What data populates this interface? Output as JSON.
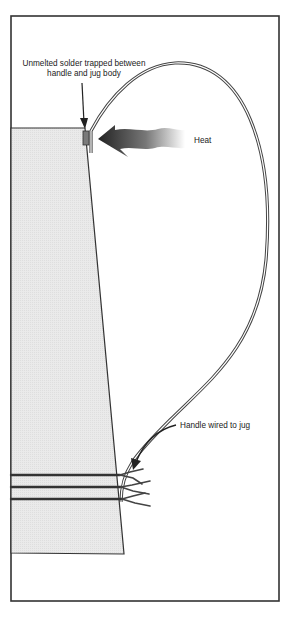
{
  "diagram": {
    "title": "",
    "labels": {
      "solder": "Unmelted solder trapped between handle and jug body",
      "heat": "Heat",
      "wired": "Handle wired to jug"
    },
    "components": [
      "frame",
      "jug-body",
      "handle-wire",
      "solder-joint",
      "heat-arrow",
      "binding-wires"
    ],
    "colors": {
      "frame": "#333333",
      "jug_fill": "#e9e9e9",
      "solder": "#7a7a7a",
      "heat_dark": "#2a2a2a",
      "heat_light": "#ffffff"
    }
  }
}
